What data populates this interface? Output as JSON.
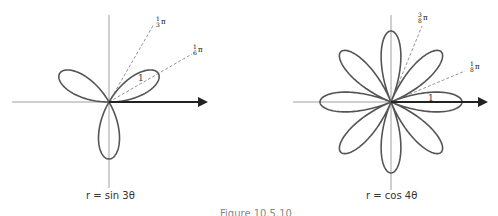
{
  "left_graph": {
    "equation": "r = sin 3θ",
    "ray_labels": [
      "1/3 π",
      "1/6 π"
    ],
    "petal_label": "1"
  },
  "right_graph": {
    "equation": "r = cos 4θ",
    "ray_labels": [
      "3/8 π",
      "1/8 π"
    ],
    "petal_label": "1"
  },
  "figure_caption": "Figure 10.5.10",
  "colors": {
    "curve": "#555555",
    "axis": "#777777",
    "arrow": "#222222"
  }
}
